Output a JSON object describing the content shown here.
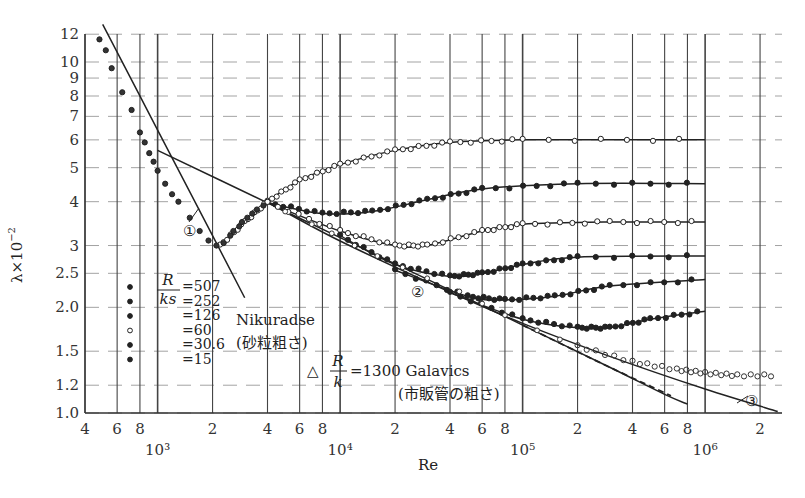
{
  "chart_data": {
    "type": "line",
    "title": "",
    "xlabel": "Re",
    "ylabel": "λ×10^-2",
    "x_scale": "log",
    "y_scale": "log",
    "xlim": [
      400,
      2500000
    ],
    "ylim": [
      1.0,
      12
    ],
    "grid": true,
    "x_ticks": [
      {
        "value": 400,
        "label": "4"
      },
      {
        "value": 600,
        "label": "6"
      },
      {
        "value": 800,
        "label": "8"
      },
      {
        "value": 1000,
        "label": "10³",
        "decade": true
      },
      {
        "value": 2000,
        "label": "2"
      },
      {
        "value": 4000,
        "label": "4"
      },
      {
        "value": 6000,
        "label": "6"
      },
      {
        "value": 8000,
        "label": "8"
      },
      {
        "value": 10000,
        "label": "10⁴",
        "decade": true
      },
      {
        "value": 20000,
        "label": "2"
      },
      {
        "value": 40000,
        "label": "4"
      },
      {
        "value": 60000,
        "label": "6"
      },
      {
        "value": 80000,
        "label": "8"
      },
      {
        "value": 100000,
        "label": "10⁵",
        "decade": true
      },
      {
        "value": 200000,
        "label": "2"
      },
      {
        "value": 400000,
        "label": "4"
      },
      {
        "value": 600000,
        "label": "6"
      },
      {
        "value": 800000,
        "label": "8"
      },
      {
        "value": 1000000,
        "label": "10⁶",
        "decade": true
      },
      {
        "value": 2000000,
        "label": "2"
      }
    ],
    "y_ticks": [
      {
        "value": 1.0,
        "label": "1.0"
      },
      {
        "value": 1.2,
        "label": "1.2"
      },
      {
        "value": 1.5,
        "label": "1.5"
      },
      {
        "value": 2.0,
        "label": "2.0"
      },
      {
        "value": 2.5,
        "label": "2.5"
      },
      {
        "value": 3,
        "label": "3"
      },
      {
        "value": 4,
        "label": "4"
      },
      {
        "value": 5,
        "label": "5"
      },
      {
        "value": 6,
        "label": "6"
      },
      {
        "value": 7,
        "label": "7"
      },
      {
        "value": 8,
        "label": "8"
      },
      {
        "value": 9,
        "label": "9"
      },
      {
        "value": 10,
        "label": "10"
      },
      {
        "value": 12,
        "label": "12"
      }
    ],
    "legend": {
      "header_num": "R",
      "header_den": "ks",
      "entries": [
        {
          "label": "=507",
          "marker": "filled"
        },
        {
          "label": "=252",
          "marker": "filled"
        },
        {
          "label": "=126",
          "marker": "filled"
        },
        {
          "label": "=60",
          "marker": "open"
        },
        {
          "label": "=30.6",
          "marker": "filled"
        },
        {
          "label": "=15",
          "marker": "filled"
        }
      ]
    },
    "annotations": [
      {
        "text": "①",
        "note": "laminar line λ=64/Re",
        "x": 1400,
        "y": 3.3
      },
      {
        "text": "②",
        "note": "smooth pipe line",
        "x": 26000,
        "y": 2.2
      },
      {
        "text": "③",
        "note": "smooth pipe (Prandtl-Kármán)",
        "x": 1400000,
        "y": 1.1
      },
      {
        "text": "Nikuradse",
        "x": 6000,
        "y": 1.85
      },
      {
        "text": "(砂粒粗さ)",
        "x": 6000,
        "y": 1.65
      },
      {
        "text": "△",
        "x": 10500,
        "y": 1.28
      },
      {
        "text": "R/k =1300 Galavics",
        "x": 18000,
        "y": 1.28
      },
      {
        "text": "(市販管の粗さ)",
        "x": 19000,
        "y": 1.13
      }
    ],
    "series": [
      {
        "name": "laminar ① (64/Re)",
        "style": "solid",
        "points": [
          [
            500,
            12.8
          ],
          [
            1000,
            6.4
          ],
          [
            2000,
            3.2
          ],
          [
            3000,
            2.13
          ]
        ]
      },
      {
        "name": "Blasius ② (smooth, 0.3164Re^-0.25)",
        "style": "solid",
        "points": [
          [
            1000,
            5.6
          ],
          [
            4000,
            3.97
          ],
          [
            10000,
            3.16
          ],
          [
            40000,
            2.24
          ],
          [
            100000,
            1.78
          ],
          [
            300000,
            1.35
          ],
          [
            600000,
            1.13
          ],
          [
            800000,
            1.06
          ]
        ]
      },
      {
        "name": "Blasius extension (dashed)",
        "style": "dashed",
        "points": [
          [
            100000,
            1.78
          ],
          [
            300000,
            1.35
          ],
          [
            650000,
            1.12
          ]
        ]
      },
      {
        "name": "smooth ③ (Prandtl-Kármán)",
        "style": "solid",
        "points": [
          [
            4000,
            3.99
          ],
          [
            10000,
            3.09
          ],
          [
            40000,
            2.21
          ],
          [
            100000,
            1.8
          ],
          [
            300000,
            1.45
          ],
          [
            1000000,
            1.17
          ],
          [
            2500000,
            1.01
          ]
        ]
      },
      {
        "name": "R/ks=15",
        "style": "solid",
        "points": [
          [
            2200,
            3.0
          ],
          [
            3000,
            3.5
          ],
          [
            4000,
            4.0
          ],
          [
            6000,
            4.6
          ],
          [
            10000,
            5.1
          ],
          [
            20000,
            5.6
          ],
          [
            40000,
            5.9
          ],
          [
            100000,
            6.0
          ],
          [
            1000000,
            6.0
          ]
        ]
      },
      {
        "name": "R/ks=30.6",
        "style": "solid",
        "points": [
          [
            4000,
            3.97
          ],
          [
            8000,
            3.7
          ],
          [
            15000,
            3.75
          ],
          [
            30000,
            4.05
          ],
          [
            60000,
            4.35
          ],
          [
            200000,
            4.5
          ],
          [
            1000000,
            4.5
          ]
        ]
      },
      {
        "name": "R/ks=60",
        "style": "solid",
        "points": [
          [
            4000,
            3.97
          ],
          [
            10000,
            3.3
          ],
          [
            20000,
            3.0
          ],
          [
            30000,
            3.0
          ],
          [
            60000,
            3.3
          ],
          [
            100000,
            3.45
          ],
          [
            300000,
            3.5
          ],
          [
            1000000,
            3.5
          ]
        ]
      },
      {
        "name": "R/ks=126",
        "style": "solid",
        "points": [
          [
            10000,
            3.2
          ],
          [
            20000,
            2.65
          ],
          [
            40000,
            2.45
          ],
          [
            60000,
            2.5
          ],
          [
            100000,
            2.65
          ],
          [
            200000,
            2.78
          ],
          [
            1000000,
            2.8
          ]
        ]
      },
      {
        "name": "R/ks=252",
        "style": "solid",
        "points": [
          [
            20000,
            2.55
          ],
          [
            50000,
            2.15
          ],
          [
            80000,
            2.1
          ],
          [
            150000,
            2.15
          ],
          [
            300000,
            2.3
          ],
          [
            1000000,
            2.4
          ]
        ]
      },
      {
        "name": "R/ks=507",
        "style": "solid",
        "points": [
          [
            40000,
            2.2
          ],
          [
            100000,
            1.85
          ],
          [
            200000,
            1.75
          ],
          [
            300000,
            1.75
          ],
          [
            500000,
            1.85
          ],
          [
            1000000,
            1.95
          ]
        ]
      },
      {
        "name": "Galavics R/k=1300 (data)",
        "style": "points",
        "points": [
          [
            200000,
            1.55
          ],
          [
            400000,
            1.4
          ],
          [
            700000,
            1.33
          ],
          [
            1000000,
            1.3
          ],
          [
            1500000,
            1.28
          ],
          [
            2500000,
            1.28
          ]
        ]
      }
    ]
  }
}
